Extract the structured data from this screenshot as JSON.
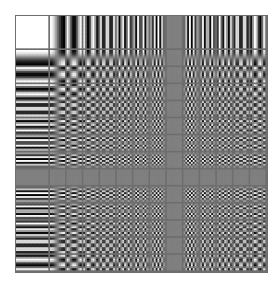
{
  "figure": {
    "grid": {
      "columns": 14,
      "rows": 14,
      "first_cell_size": 32,
      "cell_size": 16.3,
      "gap": 2,
      "border_color": "#6e6e6e",
      "samples_per_cell": 8
    }
  }
}
